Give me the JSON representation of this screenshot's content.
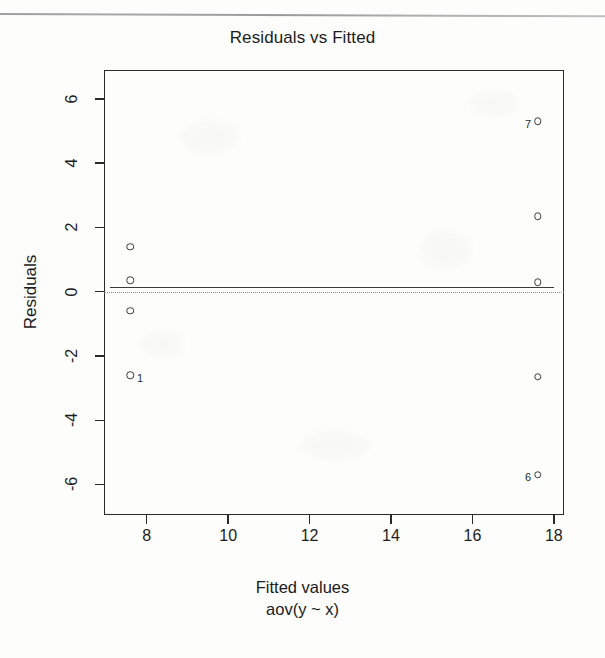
{
  "figure": {
    "title": "Residuals vs Fitted",
    "xlabel": "Fitted values",
    "sublabel": "aov(y ~ x)",
    "ylabel": "Residuals"
  },
  "chart_data": {
    "type": "scatter",
    "title": "Residuals vs Fitted",
    "xlabel": "Fitted values",
    "sublabel": "aov(y ~ x)",
    "ylabel": "Residuals",
    "xlim": [
      6.95,
      18.25
    ],
    "ylim": [
      -6.95,
      6.9
    ],
    "xticks": [
      8,
      10,
      12,
      14,
      16,
      18
    ],
    "yticks": [
      6,
      4,
      2,
      0,
      -2,
      -4,
      -6
    ],
    "xtick_labels": [
      "8",
      "10",
      "12",
      "14",
      "16",
      "18"
    ],
    "ytick_labels": [
      "6",
      "4",
      "2",
      "0",
      "-2",
      "-4",
      "-6"
    ],
    "grid": false,
    "legend": false,
    "marker": "open-circle",
    "reference_line": {
      "y": 0,
      "style": "dotted",
      "color": "#8b8b8b"
    },
    "smoother": {
      "style": "solid",
      "color": "#3b3b3b",
      "x": [
        7.6,
        17.6
      ],
      "y": [
        0.12,
        0.12
      ]
    },
    "points": [
      {
        "x": 7.6,
        "y": 1.4,
        "label": ""
      },
      {
        "x": 7.6,
        "y": 0.35,
        "label": ""
      },
      {
        "x": 7.6,
        "y": -0.6,
        "label": ""
      },
      {
        "x": 7.6,
        "y": -2.6,
        "label": "1",
        "label_side": "right"
      },
      {
        "x": 17.6,
        "y": 5.3,
        "label": "7",
        "label_side": "left"
      },
      {
        "x": 17.6,
        "y": 2.35,
        "label": ""
      },
      {
        "x": 17.6,
        "y": 0.3,
        "label": ""
      },
      {
        "x": 17.6,
        "y": -2.65,
        "label": ""
      },
      {
        "x": 17.6,
        "y": -5.7,
        "label": "6",
        "label_side": "left"
      }
    ]
  }
}
